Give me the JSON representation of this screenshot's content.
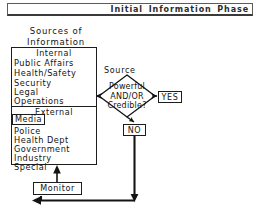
{
  "header": {
    "title": "Initial  Information  Phase"
  },
  "sources_panel": {
    "title_line1": "Sources of",
    "title_line2": "Information",
    "internal_heading": "Internal",
    "internal_items": [
      "Public  Affairs",
      "Health/Safety",
      "Security",
      "Legal",
      "Operations"
    ],
    "external_heading": "External",
    "external_highlighted_item": "Media",
    "external_items": [
      "Police",
      "Health  Dept",
      "Government",
      "Industry",
      "Special"
    ]
  },
  "decision": {
    "label_above": "Source",
    "line1": "Powerful",
    "line2": "AND/OR",
    "line3": "Credible?"
  },
  "outcomes": {
    "yes": "YES",
    "no": "NO"
  },
  "monitor": {
    "label": "Monitor"
  },
  "colors": {
    "ink": "#1a1a1a",
    "line": "#1d1d1d",
    "paper": "#ffffff"
  }
}
